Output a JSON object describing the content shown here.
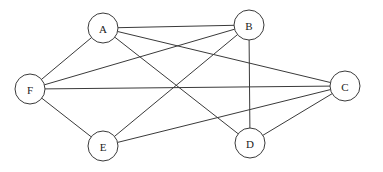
{
  "diagram": {
    "type": "undirected-graph",
    "colors": {
      "background": "#ffffff",
      "stroke": "#3a3a3a",
      "label": "#222222"
    },
    "node_radius": 15,
    "nodes": [
      {
        "id": "A",
        "label": "A",
        "x": 103,
        "y": 28
      },
      {
        "id": "B",
        "label": "B",
        "x": 249,
        "y": 25
      },
      {
        "id": "C",
        "label": "C",
        "x": 345,
        "y": 86
      },
      {
        "id": "D",
        "label": "D",
        "x": 250,
        "y": 143
      },
      {
        "id": "E",
        "label": "E",
        "x": 103,
        "y": 146
      },
      {
        "id": "F",
        "label": "F",
        "x": 30,
        "y": 89
      }
    ],
    "edges": [
      {
        "from": "A",
        "to": "F"
      },
      {
        "from": "A",
        "to": "B"
      },
      {
        "from": "A",
        "to": "C"
      },
      {
        "from": "A",
        "to": "D"
      },
      {
        "from": "F",
        "to": "B"
      },
      {
        "from": "F",
        "to": "C"
      },
      {
        "from": "F",
        "to": "E"
      },
      {
        "from": "E",
        "to": "B"
      },
      {
        "from": "E",
        "to": "C"
      },
      {
        "from": "B",
        "to": "D"
      },
      {
        "from": "D",
        "to": "C"
      }
    ]
  }
}
